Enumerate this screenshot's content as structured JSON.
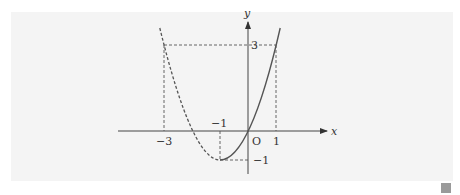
{
  "figure": {
    "function": "y = x^2 + 2x",
    "axes": {
      "x_label": "x",
      "y_label": "y",
      "origin_label": "O"
    },
    "ticks": {
      "x_neg3": "−3",
      "x_neg1": "−1",
      "x_1": "1",
      "y_3": "3",
      "y_neg1": "−1"
    },
    "solid_segment_x_range": [
      -1,
      1
    ],
    "dashed_segment_x_range": [
      -3,
      -1
    ],
    "key_points": [
      {
        "x": -3,
        "y": 3
      },
      {
        "x": -1,
        "y": -1
      },
      {
        "x": 0,
        "y": 0
      },
      {
        "x": 1,
        "y": 3
      }
    ],
    "colors": {
      "panel_bg": "#f4f4f4",
      "stroke": "#444444",
      "curve": "#555555"
    }
  }
}
